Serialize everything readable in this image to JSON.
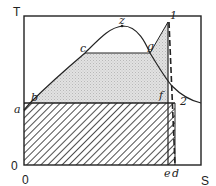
{
  "diagram": {
    "title": "",
    "type": "T-S diagram (Rankine cycle)",
    "axes": {
      "y_label": "T",
      "x_label": "S",
      "origin_y": "0",
      "origin_x": "0"
    },
    "points": [
      {
        "id": "a",
        "label": "a"
      },
      {
        "id": "b",
        "label": "b"
      },
      {
        "id": "c",
        "label": "c"
      },
      {
        "id": "z",
        "label": "z"
      },
      {
        "id": "g",
        "label": "g"
      },
      {
        "id": "1",
        "label": "1"
      },
      {
        "id": "f",
        "label": "f"
      },
      {
        "id": "2",
        "label": "2"
      },
      {
        "id": "e",
        "label": "e"
      },
      {
        "id": "d",
        "label": "d"
      }
    ],
    "regions": [
      {
        "name": "heat-added-area",
        "fill": "stippled gray",
        "bounds": "b-c-g-1-f"
      },
      {
        "name": "heat-rejected-area",
        "fill": "diagonal hatch",
        "bounds": "a-f-e-0"
      },
      {
        "name": "irreversibility-strip",
        "fill": "diagonal hatch",
        "bounds": "e-d"
      }
    ],
    "colors": {
      "line": "#222222",
      "stipple": "#d9d9d9",
      "background": "#ffffff"
    }
  }
}
